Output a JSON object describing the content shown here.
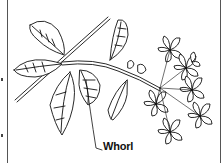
{
  "figure": {
    "labels": [
      {
        "text": "Whorl",
        "target": "node where leaves meet stem"
      }
    ]
  }
}
